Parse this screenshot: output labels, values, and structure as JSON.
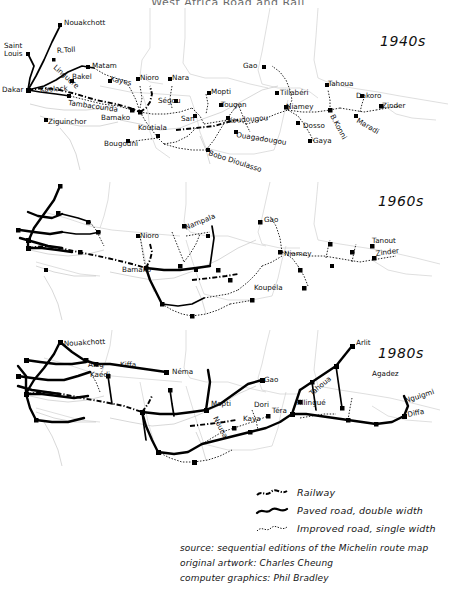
{
  "document": {
    "title": "West Africa Road and Rail",
    "background_color": "#ffffff",
    "ink_color": "#000000",
    "border_color": "#c9c9c9"
  },
  "panels": [
    {
      "id": "1940s",
      "decade_label": "1940s",
      "cities": [
        {
          "name": "Nouakchott",
          "x": 62,
          "y": 14
        },
        {
          "name": "Saint",
          "x": 9,
          "y": 37
        },
        {
          "name": "Louis",
          "x": 9,
          "y": 45
        },
        {
          "name": "R.Toll",
          "x": 57,
          "y": 42
        },
        {
          "name": "Linguere",
          "x": 56,
          "y": 56
        },
        {
          "name": "Matam",
          "x": 90,
          "y": 61
        },
        {
          "name": "Dakar",
          "x": 14,
          "y": 80
        },
        {
          "name": "Kaolack",
          "x": 55,
          "y": 80
        },
        {
          "name": "Bakel",
          "x": 74,
          "y": 74
        },
        {
          "name": "Kayes",
          "x": 111,
          "y": 75
        },
        {
          "name": "Nioro",
          "x": 140,
          "y": 72
        },
        {
          "name": "Nara",
          "x": 172,
          "y": 72
        },
        {
          "name": "Tambacounda",
          "x": 88,
          "y": 95
        },
        {
          "name": "Ziguinchor",
          "x": 48,
          "y": 114
        },
        {
          "name": "Bamako",
          "x": 126,
          "y": 109
        },
        {
          "name": "Koutiala",
          "x": 156,
          "y": 118
        },
        {
          "name": "Bougouni",
          "x": 127,
          "y": 134
        },
        {
          "name": "Segou",
          "x": 178,
          "y": 95
        },
        {
          "name": "San",
          "x": 197,
          "y": 110
        },
        {
          "name": "Mopti",
          "x": 211,
          "y": 87
        },
        {
          "name": "Tougan",
          "x": 223,
          "y": 99
        },
        {
          "name": "Koudougou",
          "x": 228,
          "y": 112
        },
        {
          "name": "Ouagadougou",
          "x": 238,
          "y": 126
        },
        {
          "name": "Bobo Dioulasso",
          "x": 212,
          "y": 143
        },
        {
          "name": "Gao",
          "x": 245,
          "y": 60
        },
        {
          "name": "Tillaberi",
          "x": 279,
          "y": 87
        },
        {
          "name": "Niamey",
          "x": 287,
          "y": 101
        },
        {
          "name": "Dosso",
          "x": 299,
          "y": 117
        },
        {
          "name": "Gaya",
          "x": 311,
          "y": 135
        },
        {
          "name": "Tahoua",
          "x": 328,
          "y": 79
        },
        {
          "name": "B.Konni",
          "x": 332,
          "y": 106
        },
        {
          "name": "Dakoro",
          "x": 364,
          "y": 90
        },
        {
          "name": "Maradi",
          "x": 357,
          "y": 110
        },
        {
          "name": "Zinder",
          "x": 383,
          "y": 100
        }
      ]
    },
    {
      "id": "1960s",
      "decade_label": "1960s",
      "cities": [
        {
          "name": "Nioro",
          "x": 143,
          "y": 236
        },
        {
          "name": "Nampala",
          "x": 186,
          "y": 225
        },
        {
          "name": "Bamako",
          "x": 126,
          "y": 270
        },
        {
          "name": "Gao",
          "x": 264,
          "y": 220
        },
        {
          "name": "Koupela",
          "x": 255,
          "y": 288
        },
        {
          "name": "Niamey",
          "x": 285,
          "y": 254
        },
        {
          "name": "Tanout",
          "x": 374,
          "y": 241
        },
        {
          "name": "Zinder",
          "x": 379,
          "y": 254
        }
      ]
    },
    {
      "id": "1980s",
      "decade_label": "1980s",
      "cities": [
        {
          "name": "Nouakchott",
          "x": 62,
          "y": 345
        },
        {
          "name": "Aleg",
          "x": 88,
          "y": 365
        },
        {
          "name": "Kaedi",
          "x": 90,
          "y": 375
        },
        {
          "name": "Kiffa",
          "x": 120,
          "y": 366
        },
        {
          "name": "Nema",
          "x": 172,
          "y": 373
        },
        {
          "name": "Gao",
          "x": 264,
          "y": 382
        },
        {
          "name": "Mopti",
          "x": 211,
          "y": 405
        },
        {
          "name": "Nouna",
          "x": 213,
          "y": 419
        },
        {
          "name": "Dori",
          "x": 255,
          "y": 406
        },
        {
          "name": "Kaya",
          "x": 244,
          "y": 421
        },
        {
          "name": "Tera",
          "x": 272,
          "y": 412
        },
        {
          "name": "Tahoua",
          "x": 312,
          "y": 395
        },
        {
          "name": "Fillingue",
          "x": 300,
          "y": 404
        },
        {
          "name": "Arlit",
          "x": 362,
          "y": 348
        },
        {
          "name": "Agadez",
          "x": 368,
          "y": 376
        },
        {
          "name": "Nguigmi",
          "x": 409,
          "y": 403
        },
        {
          "name": "Diffa",
          "x": 409,
          "y": 416
        }
      ]
    }
  ],
  "legend": {
    "items": [
      {
        "key": "railway",
        "label": "Railway",
        "style": "rail"
      },
      {
        "key": "paved-road",
        "label": "Paved road, double width",
        "style": "paved"
      },
      {
        "key": "improved-road",
        "label": "Improved road, single width",
        "style": "improved"
      }
    ]
  },
  "credits": {
    "lines": [
      "source: sequential editions of the Michelin route map",
      "original artwork:   Charles Cheung",
      "computer graphics:  Phil Bradley"
    ]
  }
}
